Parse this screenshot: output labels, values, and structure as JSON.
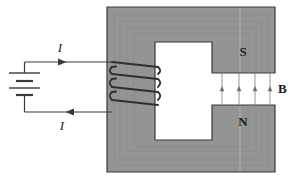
{
  "figure": {
    "type": "physics-diagram"
  },
  "colors": {
    "core_fill": "#949494",
    "core_stroke": "#3a3a3a",
    "window_fill": "#f7f7f5",
    "wire": "#3a3a3a",
    "coil": "#2f2f2f",
    "field_line": "#8a8a8a",
    "label": "#1a1a1a",
    "background": "#ffffff"
  },
  "labels": {
    "current_top": "I",
    "current_bottom": "I",
    "pole_south": "S",
    "pole_north": "N",
    "field": "B"
  },
  "battery": {
    "plates": 4,
    "terminal_top_y": 62,
    "terminal_bottom_y": 112
  },
  "coil": {
    "turns": 4,
    "top_y": 62,
    "bottom_y": 112
  },
  "field": {
    "arrow_count": 4,
    "direction": "up",
    "gap_top_y": 73,
    "gap_bottom_y": 105
  },
  "core": {
    "outer": {
      "x": 107,
      "y": 7,
      "w": 168,
      "h": 165
    },
    "window": {
      "x": 155,
      "y": 42,
      "w": 57,
      "h": 98
    },
    "gap": {
      "x": 212,
      "y": 73,
      "w": 63,
      "h": 32
    }
  }
}
